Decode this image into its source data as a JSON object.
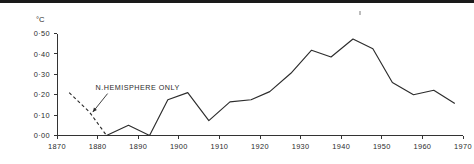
{
  "chart_data": {
    "type": "line",
    "title": "",
    "xlabel": "",
    "ylabel": "",
    "unit_label": "°C",
    "xlim": [
      1870,
      1970
    ],
    "ylim": [
      0.0,
      0.5
    ],
    "grid": false,
    "legend": "none",
    "x_ticks": [
      1870,
      1880,
      1890,
      1900,
      1910,
      1920,
      1930,
      1940,
      1950,
      1960,
      1970
    ],
    "x_tick_labels": [
      "1870",
      "1880",
      "1890",
      "1900",
      "1910",
      "1920",
      "1930",
      "1940",
      "1950",
      "1960",
      "1970"
    ],
    "y_ticks": [
      0.0,
      0.1,
      0.2,
      0.3,
      0.4,
      0.5
    ],
    "y_tick_labels": [
      "0·00",
      "0·10",
      "0·20",
      "0·30",
      "0·40",
      "0·50"
    ],
    "annotations": [
      {
        "text": "N.HEMISPHERE ONLY",
        "x": 1879.5,
        "y": 0.225,
        "points_to_x": 1878.2,
        "points_to_y": 0.115,
        "style": "arrow-leader"
      }
    ],
    "series": [
      {
        "name": "N. Hemisphere only (dashed)",
        "style": "dashed",
        "x": [
          1873.0,
          1878.0,
          1882.2
        ],
        "values": [
          0.21,
          0.115,
          0.0
        ]
      },
      {
        "name": "Global temperature anomaly (solid)",
        "style": "solid",
        "x": [
          1882.2,
          1887.6,
          1892.8,
          1897.3,
          1902.2,
          1907.4,
          1912.6,
          1917.8,
          1922.4,
          1927.6,
          1932.7,
          1937.5,
          1942.9,
          1947.8,
          1952.6,
          1957.8,
          1962.8,
          1967.9
        ],
        "values": [
          0.0,
          0.05,
          0.0,
          0.175,
          0.21,
          0.073,
          0.165,
          0.175,
          0.215,
          0.305,
          0.418,
          0.385,
          0.473,
          0.425,
          0.26,
          0.2,
          0.222,
          0.158
        ]
      }
    ]
  },
  "axes": {
    "y_axis_name": "temperature-anomaly-axis",
    "x_axis_name": "year-axis"
  }
}
